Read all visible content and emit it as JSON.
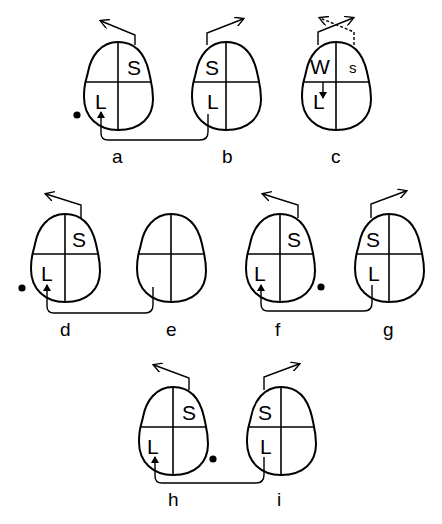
{
  "figure": {
    "panels": [
      {
        "id": "a",
        "label": "a",
        "regions": {
          "upper_right": "S",
          "lower_left": "L"
        },
        "dot": true
      },
      {
        "id": "b",
        "label": "b",
        "regions": {
          "upper_left": "S",
          "lower_left": "L"
        },
        "dot": false
      },
      {
        "id": "c",
        "label": "c",
        "regions": {
          "upper_left": "W",
          "upper_right": "s",
          "lower_left": "L"
        },
        "dot": false
      },
      {
        "id": "d",
        "label": "d",
        "regions": {
          "upper_right": "S",
          "lower_left": "L"
        },
        "dot": true
      },
      {
        "id": "e",
        "label": "e",
        "regions": {},
        "dot": false
      },
      {
        "id": "f",
        "label": "f",
        "regions": {
          "upper_right": "S",
          "lower_left": "L"
        },
        "dot": true
      },
      {
        "id": "g",
        "label": "g",
        "regions": {
          "upper_left": "S",
          "lower_left": "L"
        },
        "dot": false
      },
      {
        "id": "h",
        "label": "h",
        "regions": {
          "upper_right": "S",
          "lower_left": "L"
        },
        "dot": true
      },
      {
        "id": "i",
        "label": "i",
        "regions": {
          "upper_left": "S",
          "lower_left": "L"
        },
        "dot": false
      }
    ],
    "connections": [
      {
        "from": "b",
        "to": "a"
      },
      {
        "from": "e",
        "to": "d"
      },
      {
        "from": "g",
        "to": "f"
      },
      {
        "from": "i",
        "to": "h"
      }
    ]
  }
}
